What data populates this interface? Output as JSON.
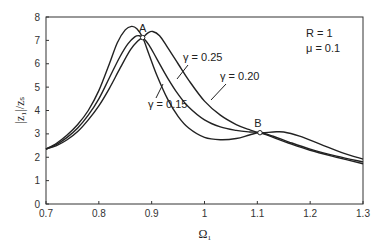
{
  "chart_data": {
    "type": "line",
    "title": "",
    "xlabel": "Ω₁",
    "ylabel": "|z₁|/zₛ",
    "xlim": [
      0.7,
      1.3
    ],
    "ylim": [
      0,
      8
    ],
    "xticks": [
      0.7,
      0.8,
      0.9,
      1.0,
      1.1,
      1.2,
      1.3
    ],
    "xtick_labels": [
      "0.7",
      "0.8",
      "0.9",
      "1",
      "1.1",
      "1.2",
      "1.3"
    ],
    "yticks": [
      0,
      1,
      2,
      3,
      4,
      5,
      6,
      7,
      8
    ],
    "ytick_labels": [
      "0",
      "1",
      "2",
      "3",
      "4",
      "5",
      "6",
      "7",
      "8"
    ],
    "grid": false,
    "legend": "none (inline labels)",
    "parameters": {
      "R": "R = 1",
      "mu": "μ = 0.1"
    },
    "fixed_points": [
      {
        "label": "A",
        "x": 0.883,
        "y": 7.12
      },
      {
        "label": "B",
        "x": 1.105,
        "y": 3.05
      }
    ],
    "series": [
      {
        "name": "γ = 0.15",
        "label_text": "γ = 0.15",
        "x": [
          0.7,
          0.72,
          0.74,
          0.76,
          0.78,
          0.8,
          0.82,
          0.835,
          0.85,
          0.862,
          0.872,
          0.883,
          0.895,
          0.91,
          0.93,
          0.95,
          0.97,
          1.0,
          1.03,
          1.06,
          1.085,
          1.105,
          1.13,
          1.16,
          1.2,
          1.25,
          1.3
        ],
        "y": [
          2.35,
          2.6,
          2.95,
          3.4,
          4.0,
          4.85,
          6.0,
          6.9,
          7.45,
          7.6,
          7.5,
          7.12,
          6.4,
          5.5,
          4.5,
          3.75,
          3.25,
          2.85,
          2.75,
          2.8,
          2.95,
          3.05,
          2.9,
          2.65,
          2.35,
          2.05,
          1.8
        ]
      },
      {
        "name": "γ = 0.20",
        "label_text": "γ = 0.20",
        "x": [
          0.7,
          0.72,
          0.74,
          0.76,
          0.78,
          0.8,
          0.82,
          0.84,
          0.855,
          0.868,
          0.876,
          0.883,
          0.895,
          0.91,
          0.93,
          0.95,
          0.97,
          1.0,
          1.03,
          1.06,
          1.085,
          1.105,
          1.13,
          1.16,
          1.2,
          1.25,
          1.3
        ],
        "y": [
          2.35,
          2.55,
          2.85,
          3.25,
          3.8,
          4.5,
          5.4,
          6.3,
          6.85,
          7.15,
          7.2,
          7.12,
          6.8,
          6.2,
          5.4,
          4.7,
          4.15,
          3.6,
          3.3,
          3.15,
          3.08,
          3.05,
          2.85,
          2.6,
          2.3,
          2.0,
          1.72
        ]
      },
      {
        "name": "γ = 0.25",
        "label_text": "γ = 0.25",
        "x": [
          0.7,
          0.72,
          0.74,
          0.76,
          0.78,
          0.8,
          0.82,
          0.84,
          0.86,
          0.875,
          0.883,
          0.893,
          0.902,
          0.915,
          0.93,
          0.95,
          0.97,
          1.0,
          1.03,
          1.06,
          1.085,
          1.105,
          1.13,
          1.15,
          1.18,
          1.22,
          1.26,
          1.3
        ],
        "y": [
          2.35,
          2.5,
          2.75,
          3.1,
          3.6,
          4.2,
          4.95,
          5.8,
          6.6,
          7.0,
          7.12,
          7.32,
          7.38,
          7.2,
          6.7,
          6.0,
          5.3,
          4.4,
          3.8,
          3.4,
          3.18,
          3.05,
          3.08,
          3.08,
          2.9,
          2.55,
          2.2,
          1.92
        ]
      }
    ]
  }
}
